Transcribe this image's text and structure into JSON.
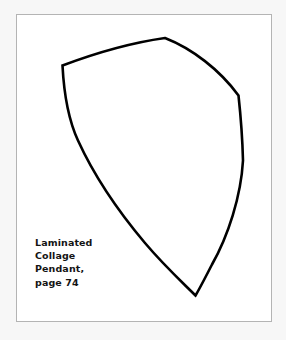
{
  "page": {
    "background_color": "#f7f7f7",
    "sheet_color": "#ffffff"
  },
  "frame": {
    "name": "pattern-frame",
    "border_color": "#b4b4b4",
    "fill_color": "#ffffff"
  },
  "pattern": {
    "name": "pendant-shield-outline",
    "stroke_color": "#000000",
    "fill_color": "none",
    "stroke_width": 2.6,
    "description": "Shield / kite shaped pendant cutting template outline"
  },
  "caption": {
    "lines": [
      "Laminated",
      "Collage",
      "Pendant,",
      "page 74"
    ],
    "line1": "Laminated",
    "line2": "Collage",
    "line3": "Pendant,",
    "line4": "page 74",
    "text_color": "#141414"
  }
}
